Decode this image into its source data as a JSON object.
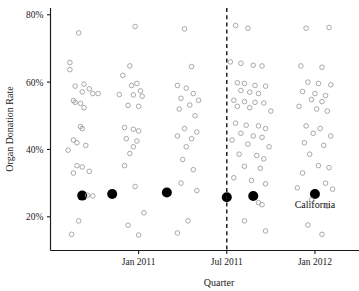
{
  "chart_data": {
    "type": "scatter",
    "title": "",
    "xlabel": "Quarter",
    "ylabel": "Organ Donation Rate",
    "grid": false,
    "legend": null,
    "xlim": [
      2010.5,
      2012.25
    ],
    "ylim": [
      0.1,
      0.82
    ],
    "x_tick_labels": [
      "Jan 2011",
      "Jul 2011",
      "Jan 2012"
    ],
    "x_tick_values": [
      2011.0,
      2011.5,
      2012.0
    ],
    "y_tick_labels": [
      "20%",
      "40%",
      "60%",
      "80%"
    ],
    "y_tick_values": [
      0.2,
      0.4,
      0.6,
      0.8
    ],
    "annotations": [
      {
        "text": "California",
        "x": 2012.0,
        "y": 0.225,
        "kind": "series-label"
      },
      {
        "text": "",
        "x": 2011.5,
        "y": null,
        "kind": "vertical-dashed-reference-line"
      }
    ],
    "series": [
      {
        "name": "California",
        "style": "filled-black-circle",
        "color": "#000000",
        "points": [
          {
            "x": 2010.68,
            "y": 0.263
          },
          {
            "x": 2010.85,
            "y": 0.268
          },
          {
            "x": 2011.16,
            "y": 0.272
          },
          {
            "x": 2011.5,
            "y": 0.258
          },
          {
            "x": 2011.65,
            "y": 0.262
          },
          {
            "x": 2012.0,
            "y": 0.268
          }
        ]
      },
      {
        "name": "Other states",
        "style": "open-gray-circle",
        "color": "#9a9a9a",
        "points": [
          {
            "x": 2010.66,
            "y": 0.746
          },
          {
            "x": 2010.61,
            "y": 0.658
          },
          {
            "x": 2010.61,
            "y": 0.637
          },
          {
            "x": 2010.64,
            "y": 0.588
          },
          {
            "x": 2010.69,
            "y": 0.594
          },
          {
            "x": 2010.68,
            "y": 0.571
          },
          {
            "x": 2010.72,
            "y": 0.58
          },
          {
            "x": 2010.74,
            "y": 0.566
          },
          {
            "x": 2010.77,
            "y": 0.566
          },
          {
            "x": 2010.63,
            "y": 0.545
          },
          {
            "x": 2010.64,
            "y": 0.54
          },
          {
            "x": 2010.67,
            "y": 0.537
          },
          {
            "x": 2010.69,
            "y": 0.524
          },
          {
            "x": 2010.67,
            "y": 0.468
          },
          {
            "x": 2010.68,
            "y": 0.462
          },
          {
            "x": 2010.63,
            "y": 0.428
          },
          {
            "x": 2010.65,
            "y": 0.42
          },
          {
            "x": 2010.7,
            "y": 0.412
          },
          {
            "x": 2010.6,
            "y": 0.398
          },
          {
            "x": 2010.65,
            "y": 0.352
          },
          {
            "x": 2010.68,
            "y": 0.348
          },
          {
            "x": 2010.63,
            "y": 0.33
          },
          {
            "x": 2010.72,
            "y": 0.335
          },
          {
            "x": 2010.71,
            "y": 0.264
          },
          {
            "x": 2010.74,
            "y": 0.262
          },
          {
            "x": 2010.66,
            "y": 0.188
          },
          {
            "x": 2010.62,
            "y": 0.148
          },
          {
            "x": 2010.98,
            "y": 0.765
          },
          {
            "x": 2010.95,
            "y": 0.648
          },
          {
            "x": 2010.91,
            "y": 0.62
          },
          {
            "x": 2010.96,
            "y": 0.59
          },
          {
            "x": 2010.99,
            "y": 0.596
          },
          {
            "x": 2011.01,
            "y": 0.574
          },
          {
            "x": 2010.89,
            "y": 0.563
          },
          {
            "x": 2010.97,
            "y": 0.562
          },
          {
            "x": 2011.02,
            "y": 0.558
          },
          {
            "x": 2010.94,
            "y": 0.531
          },
          {
            "x": 2011.0,
            "y": 0.528
          },
          {
            "x": 2010.92,
            "y": 0.465
          },
          {
            "x": 2010.97,
            "y": 0.46
          },
          {
            "x": 2011.0,
            "y": 0.455
          },
          {
            "x": 2010.93,
            "y": 0.432
          },
          {
            "x": 2010.99,
            "y": 0.425
          },
          {
            "x": 2010.97,
            "y": 0.408
          },
          {
            "x": 2010.95,
            "y": 0.388
          },
          {
            "x": 2010.92,
            "y": 0.352
          },
          {
            "x": 2010.98,
            "y": 0.29
          },
          {
            "x": 2011.03,
            "y": 0.212
          },
          {
            "x": 2010.94,
            "y": 0.175
          },
          {
            "x": 2011.0,
            "y": 0.146
          },
          {
            "x": 2011.26,
            "y": 0.758
          },
          {
            "x": 2011.3,
            "y": 0.646
          },
          {
            "x": 2011.22,
            "y": 0.59
          },
          {
            "x": 2011.27,
            "y": 0.582
          },
          {
            "x": 2011.31,
            "y": 0.566
          },
          {
            "x": 2011.24,
            "y": 0.552
          },
          {
            "x": 2011.34,
            "y": 0.546
          },
          {
            "x": 2011.29,
            "y": 0.532
          },
          {
            "x": 2011.23,
            "y": 0.52
          },
          {
            "x": 2011.32,
            "y": 0.5
          },
          {
            "x": 2011.26,
            "y": 0.462
          },
          {
            "x": 2011.33,
            "y": 0.452
          },
          {
            "x": 2011.22,
            "y": 0.44
          },
          {
            "x": 2011.3,
            "y": 0.432
          },
          {
            "x": 2011.27,
            "y": 0.408
          },
          {
            "x": 2011.25,
            "y": 0.37
          },
          {
            "x": 2011.31,
            "y": 0.34
          },
          {
            "x": 2011.24,
            "y": 0.3
          },
          {
            "x": 2011.33,
            "y": 0.278
          },
          {
            "x": 2011.28,
            "y": 0.188
          },
          {
            "x": 2011.22,
            "y": 0.152
          },
          {
            "x": 2011.55,
            "y": 0.768
          },
          {
            "x": 2011.62,
            "y": 0.76
          },
          {
            "x": 2011.52,
            "y": 0.66
          },
          {
            "x": 2011.58,
            "y": 0.656
          },
          {
            "x": 2011.65,
            "y": 0.65
          },
          {
            "x": 2011.7,
            "y": 0.648
          },
          {
            "x": 2011.56,
            "y": 0.598
          },
          {
            "x": 2011.6,
            "y": 0.596
          },
          {
            "x": 2011.66,
            "y": 0.59
          },
          {
            "x": 2011.72,
            "y": 0.588
          },
          {
            "x": 2011.58,
            "y": 0.575
          },
          {
            "x": 2011.63,
            "y": 0.57
          },
          {
            "x": 2011.68,
            "y": 0.566
          },
          {
            "x": 2011.54,
            "y": 0.546
          },
          {
            "x": 2011.6,
            "y": 0.542
          },
          {
            "x": 2011.66,
            "y": 0.54
          },
          {
            "x": 2011.71,
            "y": 0.538
          },
          {
            "x": 2011.56,
            "y": 0.528
          },
          {
            "x": 2011.63,
            "y": 0.524
          },
          {
            "x": 2011.75,
            "y": 0.514
          },
          {
            "x": 2011.55,
            "y": 0.478
          },
          {
            "x": 2011.61,
            "y": 0.472
          },
          {
            "x": 2011.68,
            "y": 0.47
          },
          {
            "x": 2011.72,
            "y": 0.462
          },
          {
            "x": 2011.58,
            "y": 0.448
          },
          {
            "x": 2011.65,
            "y": 0.44
          },
          {
            "x": 2011.7,
            "y": 0.436
          },
          {
            "x": 2011.53,
            "y": 0.428
          },
          {
            "x": 2011.62,
            "y": 0.416
          },
          {
            "x": 2011.74,
            "y": 0.408
          },
          {
            "x": 2011.57,
            "y": 0.386
          },
          {
            "x": 2011.67,
            "y": 0.382
          },
          {
            "x": 2011.71,
            "y": 0.372
          },
          {
            "x": 2011.6,
            "y": 0.35
          },
          {
            "x": 2011.69,
            "y": 0.344
          },
          {
            "x": 2011.54,
            "y": 0.316
          },
          {
            "x": 2011.64,
            "y": 0.308
          },
          {
            "x": 2011.72,
            "y": 0.298
          },
          {
            "x": 2011.68,
            "y": 0.242
          },
          {
            "x": 2011.7,
            "y": 0.236
          },
          {
            "x": 2011.6,
            "y": 0.188
          },
          {
            "x": 2011.72,
            "y": 0.158
          },
          {
            "x": 2011.95,
            "y": 0.76
          },
          {
            "x": 2012.08,
            "y": 0.762
          },
          {
            "x": 2011.92,
            "y": 0.648
          },
          {
            "x": 2012.04,
            "y": 0.644
          },
          {
            "x": 2011.96,
            "y": 0.6
          },
          {
            "x": 2012.02,
            "y": 0.596
          },
          {
            "x": 2012.09,
            "y": 0.592
          },
          {
            "x": 2011.93,
            "y": 0.572
          },
          {
            "x": 2012.0,
            "y": 0.566
          },
          {
            "x": 2012.06,
            "y": 0.56
          },
          {
            "x": 2011.98,
            "y": 0.548
          },
          {
            "x": 2012.04,
            "y": 0.542
          },
          {
            "x": 2011.91,
            "y": 0.528
          },
          {
            "x": 2012.01,
            "y": 0.52
          },
          {
            "x": 2012.07,
            "y": 0.514
          },
          {
            "x": 2011.95,
            "y": 0.47
          },
          {
            "x": 2012.03,
            "y": 0.462
          },
          {
            "x": 2011.99,
            "y": 0.448
          },
          {
            "x": 2012.09,
            "y": 0.44
          },
          {
            "x": 2011.94,
            "y": 0.42
          },
          {
            "x": 2012.05,
            "y": 0.412
          },
          {
            "x": 2011.97,
            "y": 0.386
          },
          {
            "x": 2012.02,
            "y": 0.352
          },
          {
            "x": 2012.08,
            "y": 0.346
          },
          {
            "x": 2011.93,
            "y": 0.33
          },
          {
            "x": 2012.06,
            "y": 0.3
          },
          {
            "x": 2011.9,
            "y": 0.286
          },
          {
            "x": 2012.1,
            "y": 0.282
          },
          {
            "x": 2011.98,
            "y": 0.25
          },
          {
            "x": 2012.07,
            "y": 0.232
          },
          {
            "x": 2011.96,
            "y": 0.176
          },
          {
            "x": 2012.04,
            "y": 0.148
          }
        ]
      }
    ]
  },
  "colors": {
    "axis": "#1a1a1a",
    "open_point": "#9a9a9a",
    "highlight_point": "#000000",
    "reference_line": "#141414",
    "background": "#ffffff"
  }
}
